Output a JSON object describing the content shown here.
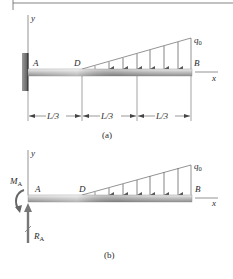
{
  "figure": {
    "top_rule": true,
    "part_a": {
      "caption": "(a)",
      "axis_y_label": "y",
      "axis_x_label": "x",
      "point_A": "A",
      "point_D": "D",
      "point_B": "B",
      "load_label": "q",
      "load_subscript": "0",
      "dimensions": [
        "L/3",
        "L/3",
        "L/3"
      ],
      "support": "fixed-wall"
    },
    "part_b": {
      "caption": "(b)",
      "axis_y_label": "y",
      "axis_x_label": "x",
      "point_A": "A",
      "point_D": "D",
      "point_B": "B",
      "load_label": "q",
      "load_subscript": "0",
      "moment_label": "M",
      "moment_subscript": "A",
      "reaction_label": "R",
      "reaction_subscript": "A"
    },
    "colors": {
      "line": "#555555",
      "beam_light": "#d8d8d8",
      "beam_dark": "#9a9a9a",
      "wall": "#6e6e6e",
      "text": "#2a2a2a"
    }
  }
}
